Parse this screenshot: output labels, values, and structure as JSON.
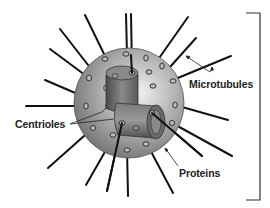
{
  "diagram": {
    "labels": {
      "microtubules": "Microtubules",
      "centrioles": "Centrioles",
      "proteins": "Proteins"
    },
    "colors": {
      "sphere_light": "#e6e6e6",
      "sphere_dark": "#6e6e6e",
      "line": "#111111",
      "bracket": "#333333"
    }
  }
}
